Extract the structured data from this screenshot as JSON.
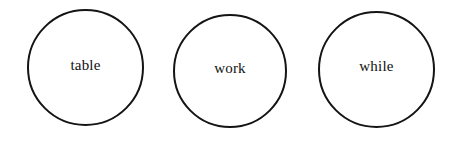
{
  "canvas": {
    "width": 464,
    "height": 143,
    "background_color": "#ffffff"
  },
  "style": {
    "circle_stroke_color": "#141414",
    "circle_stroke_width": 2,
    "circle_fill_color": "#ffffff",
    "label_color": "#111111",
    "label_font_size": 15
  },
  "nodes": [
    {
      "label": "table",
      "shape": "circle",
      "x": 27,
      "y": 9,
      "size": 117,
      "label_offset_y": -2
    },
    {
      "label": "work",
      "shape": "circle",
      "x": 173,
      "y": 14,
      "size": 114,
      "label_offset_y": -3
    },
    {
      "label": "while",
      "shape": "circle",
      "x": 318,
      "y": 11,
      "size": 117,
      "label_offset_y": -3
    }
  ]
}
